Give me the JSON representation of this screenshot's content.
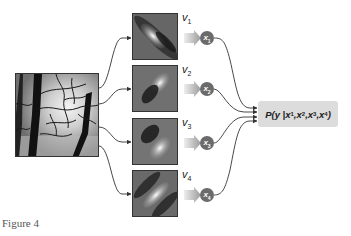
{
  "figure": {
    "caption": "Figure 4",
    "input_image": {
      "description": "natural image of tree branches against bright sky"
    },
    "filters": [
      {
        "label": "v",
        "index": "1",
        "orientation": "diagonal",
        "node": {
          "label": "x",
          "index": "1"
        }
      },
      {
        "label": "v",
        "index": "2",
        "orientation": "diagonal",
        "node": {
          "label": "x",
          "index": "2"
        }
      },
      {
        "label": "v",
        "index": "3",
        "orientation": "diagonal",
        "node": {
          "label": "x",
          "index": "3"
        }
      },
      {
        "label": "v",
        "index": "4",
        "orientation": "diagonal",
        "node": {
          "label": "x",
          "index": "4"
        }
      }
    ],
    "output": {
      "prefix": "P(y | ",
      "terms": [
        "x",
        "x",
        "x",
        "x"
      ],
      "term_indices": [
        "1",
        "2",
        "3",
        "4"
      ],
      "separator": ", ",
      "suffix": ")"
    }
  },
  "colors": {
    "node_fill": "#6b6b6b",
    "output_box": "#dcdcdc",
    "arrow_gradient_start": "#e8e8e8",
    "arrow_gradient_end": "#a0a0a0",
    "line": "#333333"
  }
}
